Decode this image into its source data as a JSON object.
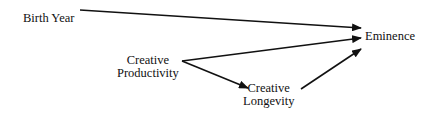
{
  "diagram": {
    "type": "path-diagram",
    "nodes": {
      "birth_year": {
        "label": "Birth Year"
      },
      "creative_productivity": {
        "line1": "Creative",
        "line2": "Productivity"
      },
      "creative_longevity": {
        "line1": "Creative",
        "line2": "Longevity"
      },
      "eminence": {
        "label": "Eminence"
      }
    },
    "edges": [
      {
        "from": "Birth Year",
        "to": "Eminence"
      },
      {
        "from": "Creative Productivity",
        "to": "Eminence"
      },
      {
        "from": "Creative Productivity",
        "to": "Creative Longevity"
      },
      {
        "from": "Creative Longevity",
        "to": "Eminence"
      }
    ],
    "colors": {
      "line": "#111111",
      "background": "#ffffff"
    }
  }
}
